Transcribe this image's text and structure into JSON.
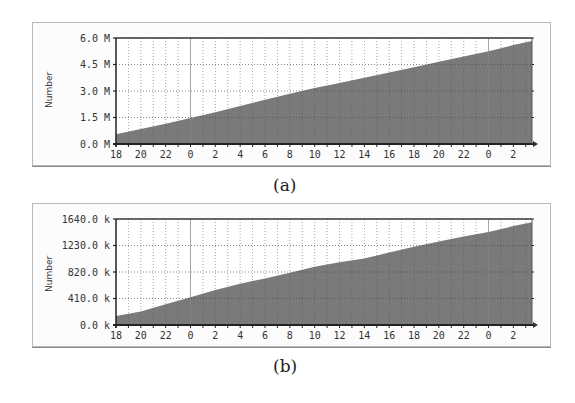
{
  "chart_data": [
    {
      "id": "a",
      "type": "area",
      "caption": "(a)",
      "title": "",
      "xlabel": "",
      "ylabel": "Number",
      "x_tick_labels": [
        "18",
        "20",
        "22",
        "0",
        "2",
        "4",
        "6",
        "8",
        "10",
        "12",
        "14",
        "16",
        "18",
        "20",
        "22",
        "0",
        "2"
      ],
      "y_tick_labels": [
        "0.0 M",
        "1.5 M",
        "3.0 M",
        "4.5 M",
        "6.0 M"
      ],
      "y_tick_values": [
        0,
        1500000,
        3000000,
        4500000,
        6000000
      ],
      "ylim": [
        0,
        6000000
      ],
      "x_hours_elapsed_range": [
        0,
        33.5
      ],
      "grid": true,
      "x": [
        0,
        2,
        4,
        6,
        8,
        10,
        12,
        14,
        16,
        18,
        20,
        22,
        24,
        26,
        28,
        30,
        32,
        33.5
      ],
      "x_labels_for_points": [
        "18",
        "20",
        "22",
        "0",
        "2",
        "4",
        "6",
        "8",
        "10",
        "12",
        "14",
        "16",
        "18",
        "20",
        "22",
        "0",
        "2",
        "~3:30"
      ],
      "values": [
        550000,
        850000,
        1150000,
        1470000,
        1800000,
        2150000,
        2500000,
        2850000,
        3170000,
        3450000,
        3750000,
        4050000,
        4350000,
        4650000,
        4950000,
        5250000,
        5600000,
        5830000
      ],
      "fill_color": "#7a7a7a"
    },
    {
      "id": "b",
      "type": "area",
      "caption": "(b)",
      "title": "",
      "xlabel": "",
      "ylabel": "Number",
      "x_tick_labels": [
        "18",
        "20",
        "22",
        "0",
        "2",
        "4",
        "6",
        "8",
        "10",
        "12",
        "14",
        "16",
        "18",
        "20",
        "22",
        "0",
        "2"
      ],
      "y_tick_labels": [
        "0.0 k",
        "410.0 k",
        "820.0 k",
        "1230.0 k",
        "1640.0 k"
      ],
      "y_tick_values": [
        0,
        410000,
        820000,
        1230000,
        1640000
      ],
      "ylim": [
        0,
        1640000
      ],
      "x_hours_elapsed_range": [
        0,
        33.5
      ],
      "grid": true,
      "x": [
        0,
        2,
        4,
        6,
        8,
        10,
        12,
        14,
        16,
        18,
        20,
        22,
        24,
        26,
        28,
        30,
        32,
        33.5
      ],
      "x_labels_for_points": [
        "18",
        "20",
        "22",
        "0",
        "2",
        "4",
        "6",
        "8",
        "10",
        "12",
        "14",
        "16",
        "18",
        "20",
        "22",
        "0",
        "2",
        "~3:30"
      ],
      "values": [
        140000,
        210000,
        320000,
        430000,
        540000,
        640000,
        720000,
        810000,
        900000,
        970000,
        1030000,
        1120000,
        1210000,
        1290000,
        1370000,
        1440000,
        1530000,
        1590000
      ],
      "fill_color": "#7a7a7a"
    }
  ]
}
